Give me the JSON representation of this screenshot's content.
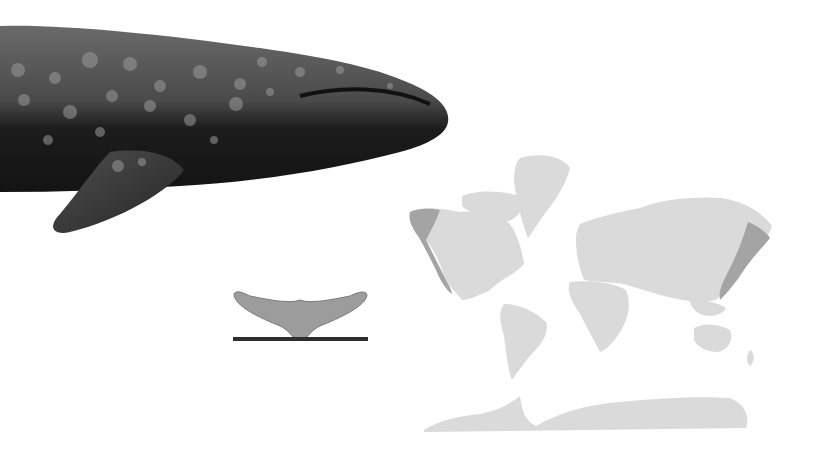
{
  "figure": {
    "background_color": "#ffffff",
    "whale": {
      "body_color": "#1e1e1e",
      "back_color": "#5a5a5a",
      "spot_color": "#8c8c8c"
    },
    "fluke": {
      "fill_color": "#9a9a9a",
      "outline_color": "#7a7a7a",
      "baseline_color": "#2e2e2e"
    },
    "map": {
      "land_color": "#dadada",
      "range_color": "#a4a4a4",
      "ranges": [
        "Eastern North Pacific",
        "Western North Pacific"
      ]
    }
  }
}
